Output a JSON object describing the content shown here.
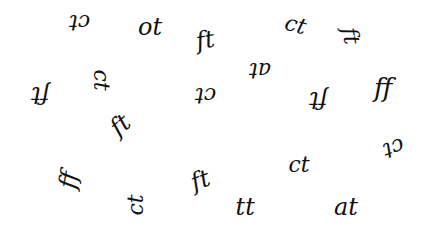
{
  "canvas": {
    "width": 427,
    "height": 229,
    "background": "#ffffff",
    "ink": "#111111"
  },
  "glyphs": [
    {
      "text": "ct",
      "x": 79,
      "y": 22,
      "rotate": 180,
      "size": 22
    },
    {
      "text": "ot",
      "x": 150,
      "y": 27,
      "rotate": 0,
      "size": 24
    },
    {
      "text": "ft",
      "x": 205,
      "y": 40,
      "rotate": -10,
      "size": 24
    },
    {
      "text": "ct",
      "x": 295,
      "y": 25,
      "rotate": 15,
      "size": 22
    },
    {
      "text": "ft",
      "x": 350,
      "y": 36,
      "rotate": 80,
      "size": 22
    },
    {
      "text": "ft",
      "x": 40,
      "y": 95,
      "rotate": 180,
      "size": 24
    },
    {
      "text": "ct",
      "x": 100,
      "y": 80,
      "rotate": 90,
      "size": 22
    },
    {
      "text": "ft",
      "x": 120,
      "y": 125,
      "rotate": -40,
      "size": 24
    },
    {
      "text": "ct",
      "x": 205,
      "y": 95,
      "rotate": 180,
      "size": 22
    },
    {
      "text": "at",
      "x": 260,
      "y": 70,
      "rotate": 180,
      "size": 22
    },
    {
      "text": "ft",
      "x": 318,
      "y": 100,
      "rotate": 180,
      "size": 24
    },
    {
      "text": "ff",
      "x": 383,
      "y": 88,
      "rotate": 0,
      "size": 26
    },
    {
      "text": "ff",
      "x": 68,
      "y": 180,
      "rotate": -80,
      "size": 24
    },
    {
      "text": "ct",
      "x": 135,
      "y": 205,
      "rotate": -90,
      "size": 22
    },
    {
      "text": "ft",
      "x": 200,
      "y": 180,
      "rotate": -20,
      "size": 24
    },
    {
      "text": "ct",
      "x": 299,
      "y": 165,
      "rotate": 0,
      "size": 22
    },
    {
      "text": "ct",
      "x": 393,
      "y": 148,
      "rotate": 160,
      "size": 22
    },
    {
      "text": "tt",
      "x": 245,
      "y": 207,
      "rotate": 0,
      "size": 24
    },
    {
      "text": "at",
      "x": 346,
      "y": 207,
      "rotate": 0,
      "size": 24
    }
  ]
}
